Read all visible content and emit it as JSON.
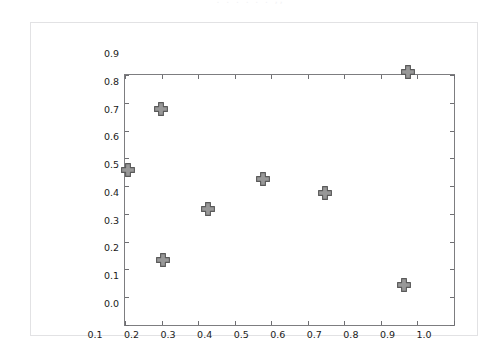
{
  "figure": {
    "top_caption": ". .  . . . . ,,",
    "background_color": "#ffffff",
    "frame_color": "#e2e2e4",
    "axes_spine_color": "#7d7d80"
  },
  "chart_data": {
    "type": "scatter",
    "title": "",
    "subtitle": "",
    "xlabel": "",
    "ylabel": "",
    "xlim": [
      0.1,
      1.0
    ],
    "ylim": [
      0.0,
      0.9
    ],
    "grid": false,
    "legend": null,
    "marker": {
      "shape": "plus-filled",
      "face_color": "#989898",
      "edge_color": "#5a5a5a",
      "size_px": 13
    },
    "xticks": [
      "0.1",
      "0.2",
      "0.3",
      "0.4",
      "0.5",
      "0.6",
      "0.7",
      "0.8",
      "0.9",
      "1.0"
    ],
    "xtick_values": [
      0.1,
      0.2,
      0.3,
      0.4,
      0.5,
      0.6,
      0.7,
      0.8,
      0.9,
      1.0
    ],
    "yticks": [
      "0.0",
      "0.1",
      "0.2",
      "0.3",
      "0.4",
      "0.5",
      "0.6",
      "0.7",
      "0.8",
      "0.9"
    ],
    "ytick_values": [
      0.0,
      0.1,
      0.2,
      0.3,
      0.4,
      0.5,
      0.6,
      0.7,
      0.8,
      0.9
    ],
    "x": [
      0.19,
      0.28,
      0.285,
      0.41,
      0.56,
      0.73,
      0.945,
      0.955
    ],
    "y": [
      0.48,
      0.7,
      0.155,
      0.34,
      0.445,
      0.395,
      0.065,
      0.83
    ],
    "points": [
      {
        "x": 0.19,
        "y": 0.48
      },
      {
        "x": 0.28,
        "y": 0.7
      },
      {
        "x": 0.285,
        "y": 0.155
      },
      {
        "x": 0.41,
        "y": 0.34
      },
      {
        "x": 0.56,
        "y": 0.445
      },
      {
        "x": 0.73,
        "y": 0.395
      },
      {
        "x": 0.945,
        "y": 0.065
      },
      {
        "x": 0.955,
        "y": 0.83
      }
    ]
  }
}
